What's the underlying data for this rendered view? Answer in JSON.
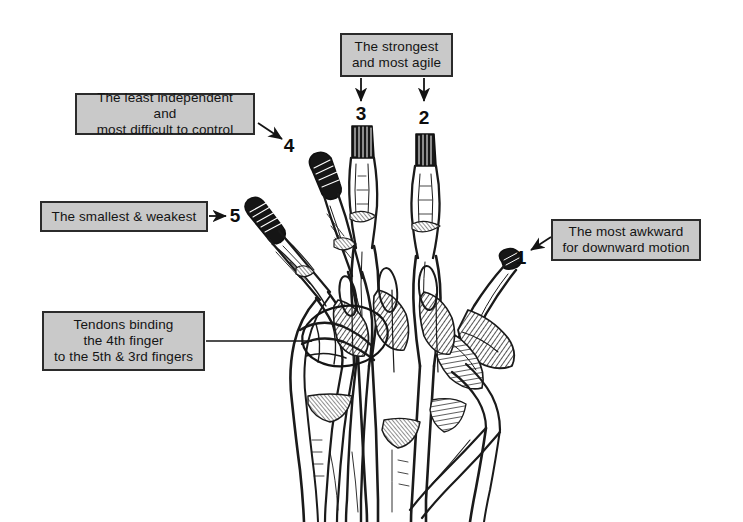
{
  "figure": {
    "background_color": "#ffffff",
    "ink_color": "#1a1a1a",
    "label_fill_color": "#c9c9c9",
    "label_border_color": "#2b2b2b"
  },
  "callouts": [
    {
      "id": "strongest",
      "text": "The strongest\nand most agile",
      "points_to": "fingers 3 and 2"
    },
    {
      "id": "least-independent",
      "text": "The least independent and\nmost difficult to control",
      "points_to": "finger 4"
    },
    {
      "id": "smallest-weakest",
      "text": "The smallest & weakest",
      "points_to": "finger 5"
    },
    {
      "id": "tendons-binding",
      "text": "Tendons binding\nthe 4th finger\nto the 5th & 3rd fingers",
      "points_to": "tendon junction circled on back of hand"
    },
    {
      "id": "most-awkward",
      "text": "The most awkward\nfor downward motion",
      "points_to": "finger 1 (thumb)"
    }
  ],
  "finger_numbers": [
    {
      "id": "finger-1",
      "label": "1",
      "name": "thumb"
    },
    {
      "id": "finger-2",
      "label": "2",
      "name": "index finger"
    },
    {
      "id": "finger-3",
      "label": "3",
      "name": "middle finger"
    },
    {
      "id": "finger-4",
      "label": "4",
      "name": "ring finger"
    },
    {
      "id": "finger-5",
      "label": "5",
      "name": "little finger"
    }
  ],
  "illustration": {
    "subject": "dorsal view of human hand showing extensor tendons, metacarpals and interosseous muscles",
    "style": "black and white engraving / line hatching"
  }
}
